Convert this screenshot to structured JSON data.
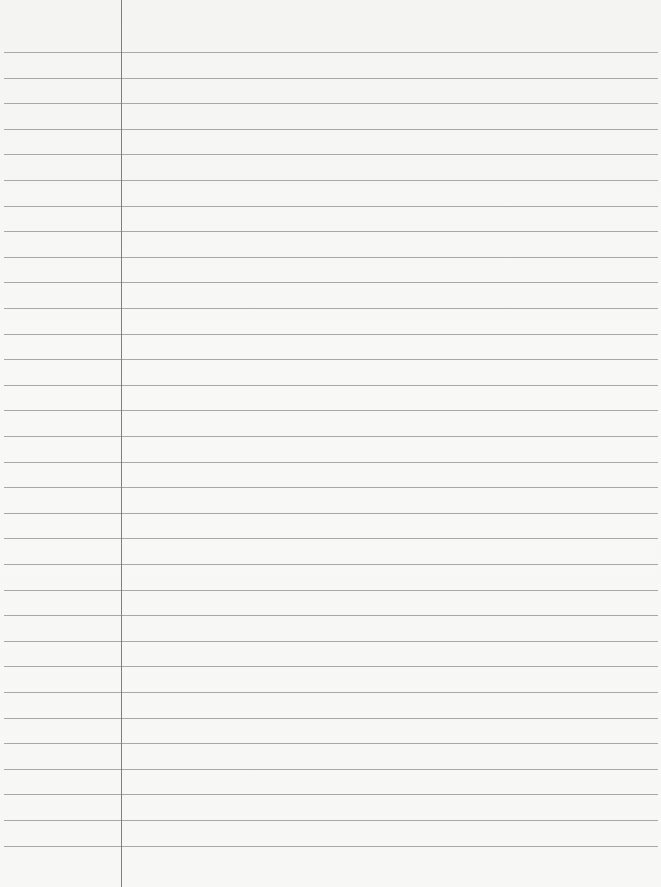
{
  "paper": {
    "type": "lined notebook paper",
    "background_color": "#f6f6f5",
    "rule_color": "#9a9a9a",
    "margin_color": "#7f7f7f",
    "margin_x": 121,
    "first_rule_y": 52,
    "rule_spacing": 25.6,
    "rule_count": 32,
    "text": ""
  }
}
